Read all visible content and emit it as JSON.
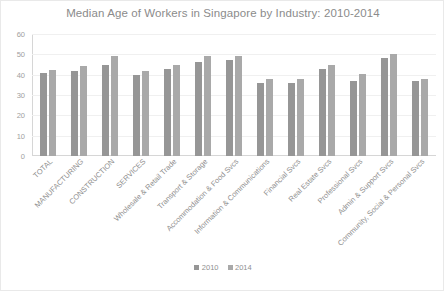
{
  "chart_data": {
    "type": "bar",
    "title": "Median Age of Workers in Singapore by Industry: 2010-2014",
    "xlabel": "",
    "ylabel": "",
    "ylim": [
      0,
      60
    ],
    "yticks": [
      60,
      50,
      40,
      30,
      20,
      10,
      0
    ],
    "grid": true,
    "legend_position": "bottom",
    "categories": [
      "TOTAL",
      "MANUFACTURING",
      "CONSTRUCTION",
      "SERVICES",
      "Wholesale & Retail Trade",
      "Transport & Storage",
      "Accommodation & Food Svcs",
      "Information & Communications",
      "Financial Svcs",
      "Real Estate Svcs",
      "Professional Svcs",
      "Admin & Support Svcs",
      "Community, Social & Personal Svcs"
    ],
    "series": [
      {
        "name": "2010",
        "color": "#969696",
        "values": [
          41,
          42,
          45,
          40,
          43,
          46,
          47,
          36,
          36,
          43,
          37,
          48,
          37
        ]
      },
      {
        "name": "2014",
        "color": "#a9a9a9",
        "values": [
          42.5,
          44.5,
          49,
          42,
          45,
          49,
          49,
          38,
          38,
          45,
          40.5,
          50,
          38
        ]
      }
    ]
  },
  "legend": {
    "entries": [
      {
        "label": "2010"
      },
      {
        "label": "2014"
      }
    ]
  },
  "colors": {
    "title": "#8b8b8b",
    "axis_text": "#a0a0a0",
    "gridline": "#f0f0f0",
    "frame": "#e9e9e9",
    "background": "#ffffff"
  }
}
